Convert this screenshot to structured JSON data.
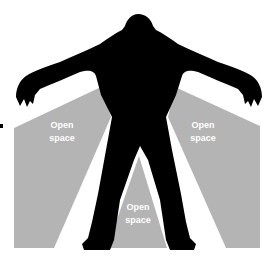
{
  "diagram": {
    "colors": {
      "background": "#ffffff",
      "silhouette": "#000000",
      "open_space": "#b4b4b4",
      "label_text": "#ffffff"
    },
    "figure": "humanoid-silhouette",
    "regions": [
      {
        "id": "left",
        "line1": "Open",
        "line2": "space"
      },
      {
        "id": "right",
        "line1": "Open",
        "line2": "space"
      },
      {
        "id": "center",
        "line1": "Open",
        "line2": "space"
      }
    ]
  }
}
